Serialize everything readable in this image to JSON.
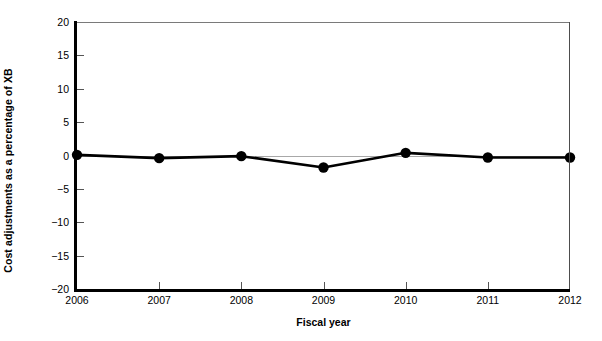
{
  "chart_data": {
    "type": "line",
    "title": "",
    "xlabel": "Fiscal year",
    "ylabel": "Cost adjustments as a percentage of XB",
    "categories": [
      "2006",
      "2007",
      "2008",
      "2009",
      "2010",
      "2011",
      "2012"
    ],
    "x": [
      2006,
      2007,
      2008,
      2009,
      2010,
      2011,
      2012
    ],
    "values": [
      0.1,
      -0.4,
      -0.1,
      -1.8,
      0.4,
      -0.3,
      -0.3
    ],
    "series": [
      {
        "name": "Cost adjustments",
        "values": [
          0.1,
          -0.4,
          -0.1,
          -1.8,
          0.4,
          -0.3,
          -0.3
        ]
      }
    ],
    "xlim": [
      2006,
      2012
    ],
    "ylim": [
      -20,
      20
    ],
    "yticks": [
      -20,
      -15,
      -10,
      -5,
      0,
      5,
      10,
      15,
      20
    ],
    "ytick_labels": [
      "−20",
      "−15",
      "−10",
      "−5",
      "0",
      "5",
      "10",
      "15",
      "20"
    ],
    "xticks": [
      2006,
      2007,
      2008,
      2009,
      2010,
      2011,
      2012
    ],
    "xtick_labels": [
      "2006",
      "2007",
      "2008",
      "2009",
      "2010",
      "2011",
      "2012"
    ],
    "grid": false,
    "zero_line": true,
    "legend": null,
    "legend_position": "none",
    "marker": "circle",
    "line_color": "#000000",
    "marker_color": "#000000",
    "zero_line_color": "#a8a8a8",
    "axis_color": "#000000",
    "background": "#ffffff"
  }
}
